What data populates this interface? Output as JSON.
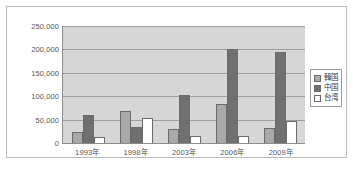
{
  "chart_data": {
    "type": "bar",
    "title": "",
    "subtitle": "",
    "xlabel": "",
    "ylabel": "",
    "categories": [
      "1993年",
      "1998年",
      "2003年",
      "2006年",
      "2009年"
    ],
    "series": [
      {
        "name": "韓国",
        "color": "#a9a9a9",
        "values": [
          23000,
          68000,
          29000,
          83000,
          32000
        ]
      },
      {
        "name": "中国",
        "color": "#707070",
        "values": [
          60000,
          34000,
          102000,
          201000,
          195000
        ]
      },
      {
        "name": "台湾",
        "color": "#ffffff",
        "values": [
          13000,
          53000,
          16000,
          14000,
          48000
        ]
      }
    ],
    "ylim": [
      0,
      250000
    ],
    "ytick_values": [
      0,
      50000,
      100000,
      150000,
      200000,
      250000
    ],
    "ytick_labels": [
      "0",
      "50,000",
      "100,000",
      "150,000",
      "200,000",
      "250,000"
    ],
    "grid": true,
    "grid_axis": "y",
    "legend_position": "right",
    "plot_background": "#d6d6d6",
    "axis_color": "#8c8c8c",
    "gridline_color": "#9d9d9d"
  },
  "legend": {
    "items": [
      {
        "label": "韓国"
      },
      {
        "label": "中国"
      },
      {
        "label": "台湾"
      }
    ]
  }
}
